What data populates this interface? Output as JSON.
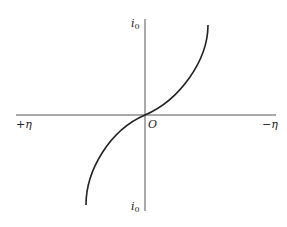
{
  "diagram": {
    "type": "polarization curve (current vs overpotential)",
    "axes": {
      "x_left_label": "+η",
      "x_right_label": "−η",
      "origin_label": "O",
      "y_top_label": {
        "main": "i",
        "sub": "0"
      },
      "y_bottom_label": {
        "main": "i",
        "sub": "0"
      }
    },
    "curve": {
      "description": "S-shaped (sinh-like) curve passing through origin, rising steeply at the upper right and falling steeply at the lower left",
      "color": "#222222"
    },
    "colors": {
      "axis": "#444444",
      "background": "#ffffff"
    }
  }
}
